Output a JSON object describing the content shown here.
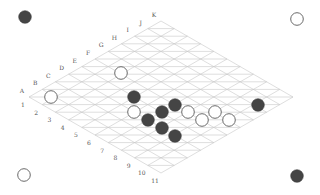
{
  "board": {
    "type": "hex",
    "size": 11,
    "columns": [
      "A",
      "B",
      "C",
      "D",
      "E",
      "F",
      "G",
      "H",
      "I",
      "J",
      "K"
    ],
    "rows": [
      "1",
      "2",
      "3",
      "4",
      "5",
      "6",
      "7",
      "8",
      "9",
      "10",
      "11"
    ],
    "colors": {
      "background": "#ffffff",
      "grid": "#c8c8c8",
      "black_stone": "#454545",
      "white_stone": "#ffffff",
      "white_stone_outline": "#6a6a6a",
      "label": "#555555"
    },
    "origin": [
      29,
      97
    ],
    "col_step": [
      13.2,
      -7.6
    ],
    "row_step": [
      13.2,
      7.6
    ]
  },
  "corner_markers": [
    {
      "position": "top-left",
      "color": "black",
      "x": 25,
      "y": 17
    },
    {
      "position": "top-right",
      "color": "white",
      "x": 297,
      "y": 19
    },
    {
      "position": "bottom-left",
      "color": "white",
      "x": 24,
      "y": 175
    },
    {
      "position": "bottom-right",
      "color": "black",
      "x": 297,
      "y": 176
    }
  ],
  "stones": [
    {
      "color": "white",
      "x": 51,
      "y": 97
    },
    {
      "color": "white",
      "x": 121,
      "y": 73
    },
    {
      "color": "black",
      "x": 134,
      "y": 97
    },
    {
      "color": "white",
      "x": 134,
      "y": 112
    },
    {
      "color": "black",
      "x": 148,
      "y": 120
    },
    {
      "color": "black",
      "x": 162,
      "y": 112
    },
    {
      "color": "black",
      "x": 175,
      "y": 105
    },
    {
      "color": "black",
      "x": 162,
      "y": 128
    },
    {
      "color": "black",
      "x": 175,
      "y": 136
    },
    {
      "color": "white",
      "x": 188,
      "y": 112
    },
    {
      "color": "white",
      "x": 202,
      "y": 120
    },
    {
      "color": "white",
      "x": 215,
      "y": 112
    },
    {
      "color": "white",
      "x": 229,
      "y": 120
    },
    {
      "color": "black",
      "x": 258,
      "y": 105
    }
  ]
}
